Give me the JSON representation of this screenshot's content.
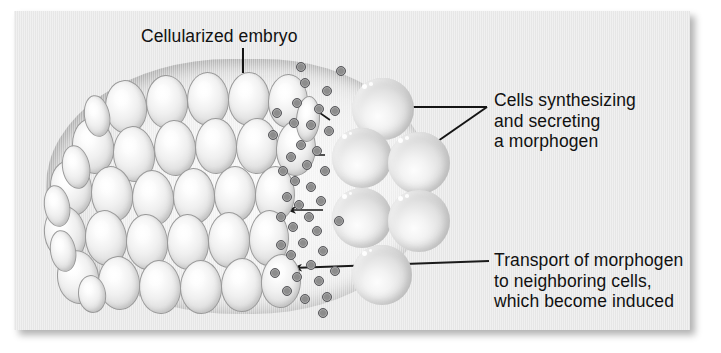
{
  "figure": {
    "kind": "biology-diagram",
    "panel_bg": "#e9e9e9",
    "text_color": "#111111"
  },
  "labels": {
    "embryo": "Cellularized embryo",
    "synthesizing": [
      "Cells synthesizing",
      "and secreting",
      "a morphogen"
    ],
    "transport": [
      "Transport of morphogen",
      "to neighboring cells,",
      "which become induced"
    ]
  },
  "structures": {
    "embryo_name": "cellularized-embryo",
    "small_cell_count": 35,
    "large_cell_count": 6,
    "morphogen_particle_count": 41,
    "arrow_count": 4
  },
  "small_cells": [
    {
      "x": 105,
      "y": 80,
      "w": 40,
      "h": 52,
      "r": -6
    },
    {
      "x": 146,
      "y": 75,
      "w": 40,
      "h": 52,
      "r": -4
    },
    {
      "x": 187,
      "y": 72,
      "w": 40,
      "h": 52,
      "r": -2
    },
    {
      "x": 228,
      "y": 72,
      "w": 40,
      "h": 52,
      "r": 0
    },
    {
      "x": 268,
      "y": 74,
      "w": 38,
      "h": 52,
      "r": 2
    },
    {
      "x": 72,
      "y": 118,
      "w": 40,
      "h": 54,
      "r": -8
    },
    {
      "x": 113,
      "y": 126,
      "w": 40,
      "h": 54,
      "r": -6
    },
    {
      "x": 154,
      "y": 120,
      "w": 40,
      "h": 54,
      "r": -3
    },
    {
      "x": 195,
      "y": 118,
      "w": 40,
      "h": 54,
      "r": -1
    },
    {
      "x": 236,
      "y": 118,
      "w": 40,
      "h": 54,
      "r": 1
    },
    {
      "x": 276,
      "y": 120,
      "w": 38,
      "h": 54,
      "r": 3
    },
    {
      "x": 50,
      "y": 160,
      "w": 40,
      "h": 54,
      "r": -9
    },
    {
      "x": 91,
      "y": 166,
      "w": 40,
      "h": 54,
      "r": -7
    },
    {
      "x": 132,
      "y": 170,
      "w": 40,
      "h": 54,
      "r": -4
    },
    {
      "x": 173,
      "y": 168,
      "w": 40,
      "h": 54,
      "r": -2
    },
    {
      "x": 214,
      "y": 166,
      "w": 40,
      "h": 54,
      "r": 0
    },
    {
      "x": 255,
      "y": 166,
      "w": 38,
      "h": 54,
      "r": 2
    },
    {
      "x": 44,
      "y": 205,
      "w": 40,
      "h": 54,
      "r": -10
    },
    {
      "x": 85,
      "y": 210,
      "w": 40,
      "h": 54,
      "r": -7
    },
    {
      "x": 126,
      "y": 214,
      "w": 40,
      "h": 54,
      "r": -4
    },
    {
      "x": 167,
      "y": 214,
      "w": 40,
      "h": 54,
      "r": -2
    },
    {
      "x": 208,
      "y": 212,
      "w": 40,
      "h": 54,
      "r": 0
    },
    {
      "x": 249,
      "y": 210,
      "w": 38,
      "h": 54,
      "r": 2
    },
    {
      "x": 57,
      "y": 250,
      "w": 40,
      "h": 52,
      "r": -9
    },
    {
      "x": 98,
      "y": 256,
      "w": 40,
      "h": 52,
      "r": -6
    },
    {
      "x": 139,
      "y": 260,
      "w": 40,
      "h": 52,
      "r": -4
    },
    {
      "x": 180,
      "y": 260,
      "w": 40,
      "h": 52,
      "r": -1
    },
    {
      "x": 221,
      "y": 258,
      "w": 40,
      "h": 52,
      "r": 1
    },
    {
      "x": 261,
      "y": 254,
      "w": 38,
      "h": 52,
      "r": 3
    },
    {
      "x": 84,
      "y": 95,
      "w": 24,
      "h": 40,
      "r": -10
    },
    {
      "x": 62,
      "y": 145,
      "w": 26,
      "h": 42,
      "r": -10
    },
    {
      "x": 44,
      "y": 185,
      "w": 24,
      "h": 40,
      "r": -10
    },
    {
      "x": 50,
      "y": 230,
      "w": 24,
      "h": 40,
      "r": -10
    },
    {
      "x": 78,
      "y": 275,
      "w": 26,
      "h": 36,
      "r": -8
    },
    {
      "x": 296,
      "y": 96,
      "w": 22,
      "h": 44,
      "r": 4
    }
  ],
  "large_cells": [
    {
      "x": 352,
      "y": 78,
      "w": 62,
      "h": 62
    },
    {
      "x": 332,
      "y": 128,
      "w": 60,
      "h": 60
    },
    {
      "x": 388,
      "y": 132,
      "w": 62,
      "h": 62
    },
    {
      "x": 332,
      "y": 188,
      "w": 60,
      "h": 60
    },
    {
      "x": 388,
      "y": 190,
      "w": 62,
      "h": 62
    },
    {
      "x": 352,
      "y": 245,
      "w": 60,
      "h": 60
    }
  ],
  "morphogen_particles": [
    {
      "x": 300,
      "y": 78
    },
    {
      "x": 322,
      "y": 86
    },
    {
      "x": 336,
      "y": 66
    },
    {
      "x": 292,
      "y": 98
    },
    {
      "x": 314,
      "y": 104
    },
    {
      "x": 306,
      "y": 120
    },
    {
      "x": 289,
      "y": 118
    },
    {
      "x": 324,
      "y": 126
    },
    {
      "x": 296,
      "y": 140
    },
    {
      "x": 312,
      "y": 146
    },
    {
      "x": 286,
      "y": 152
    },
    {
      "x": 302,
      "y": 160
    },
    {
      "x": 320,
      "y": 166
    },
    {
      "x": 290,
      "y": 176
    },
    {
      "x": 306,
      "y": 182
    },
    {
      "x": 278,
      "y": 166
    },
    {
      "x": 316,
      "y": 196
    },
    {
      "x": 294,
      "y": 200
    },
    {
      "x": 282,
      "y": 192
    },
    {
      "x": 304,
      "y": 212
    },
    {
      "x": 288,
      "y": 222
    },
    {
      "x": 312,
      "y": 226
    },
    {
      "x": 276,
      "y": 212
    },
    {
      "x": 298,
      "y": 238
    },
    {
      "x": 318,
      "y": 246
    },
    {
      "x": 286,
      "y": 250
    },
    {
      "x": 306,
      "y": 260
    },
    {
      "x": 276,
      "y": 240
    },
    {
      "x": 292,
      "y": 272
    },
    {
      "x": 314,
      "y": 276
    },
    {
      "x": 282,
      "y": 286
    },
    {
      "x": 300,
      "y": 294
    },
    {
      "x": 322,
      "y": 292
    },
    {
      "x": 270,
      "y": 268
    },
    {
      "x": 268,
      "y": 130
    },
    {
      "x": 272,
      "y": 108
    },
    {
      "x": 330,
      "y": 106
    },
    {
      "x": 334,
      "y": 216
    },
    {
      "x": 330,
      "y": 266
    },
    {
      "x": 296,
      "y": 62
    },
    {
      "x": 318,
      "y": 308
    }
  ],
  "arrows": [
    {
      "name": "arrow-diffusion-upper",
      "x1": 330,
      "y1": 120,
      "x2": 297,
      "y2": 97
    },
    {
      "name": "arrow-diffusion-mid",
      "x1": 325,
      "y1": 155,
      "x2": 288,
      "y2": 155
    },
    {
      "name": "arrow-diffusion-lower",
      "x1": 323,
      "y1": 210,
      "x2": 286,
      "y2": 210
    },
    {
      "name": "arrow-transport-callout",
      "x1": 489,
      "y1": 261,
      "x2": 292,
      "y2": 268
    }
  ],
  "leaders": [
    {
      "name": "leader-embryo",
      "x1": 243,
      "y1": 48,
      "x2": 243,
      "y2": 73
    },
    {
      "name": "leader-synth-upper",
      "x1": 487,
      "y1": 107,
      "x2": 401,
      "y2": 107
    },
    {
      "name": "leader-synth-lower",
      "x1": 487,
      "y1": 107,
      "x2": 438,
      "y2": 141
    }
  ]
}
